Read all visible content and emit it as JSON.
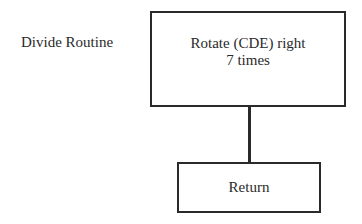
{
  "diagram": {
    "routine_label": "Divide Routine",
    "nodes": [
      {
        "id": "rotate",
        "lines": [
          "Rotate (CDE) right",
          "7 times"
        ]
      },
      {
        "id": "return",
        "lines": [
          "Return"
        ]
      }
    ],
    "edges": [
      {
        "from": "rotate",
        "to": "return"
      }
    ]
  }
}
